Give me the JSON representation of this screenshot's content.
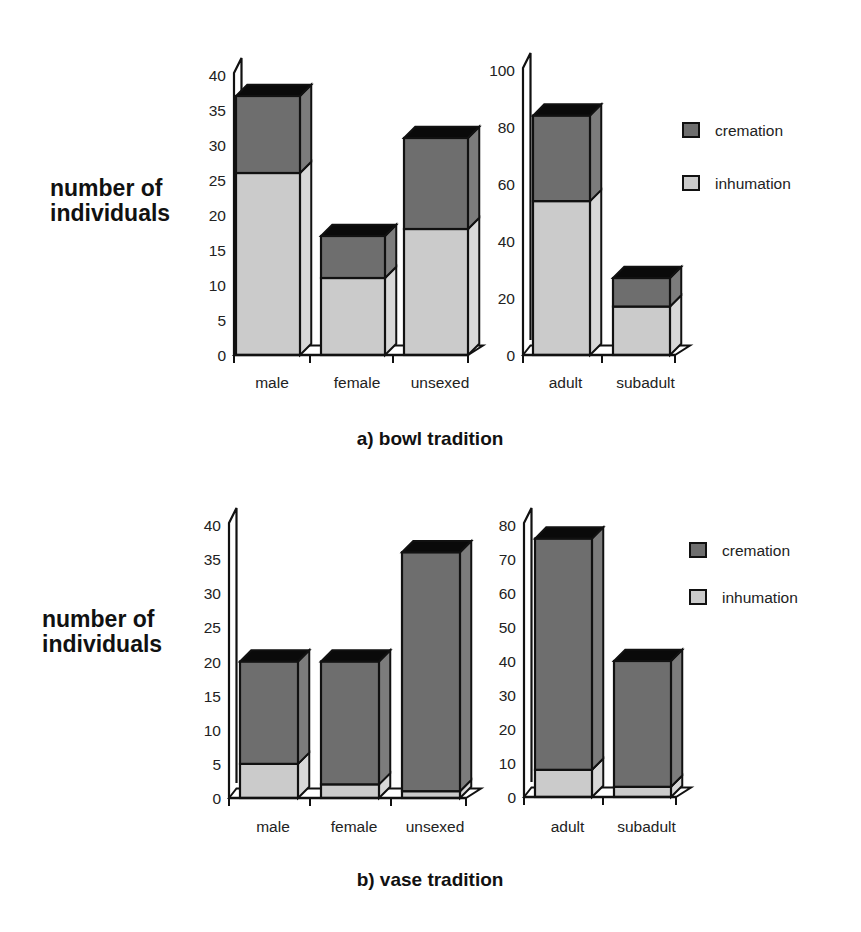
{
  "colors": {
    "cremation": "#6e6e6e",
    "cremation_side": "#7c7c7c",
    "inhumation": "#cbcbcb",
    "inhumation_side": "#d8d8d8",
    "top_face": "#0a0a0a",
    "outline": "#111111",
    "wall": "#ffffff"
  },
  "legend": [
    {
      "key": "cremation",
      "label": "cremation"
    },
    {
      "key": "inhumation",
      "label": "inhumation"
    }
  ],
  "panels": [
    {
      "title": "a) bowl tradition",
      "ylabel_lines": [
        "number of",
        "individuals"
      ]
    },
    {
      "title": "b) vase tradition",
      "ylabel_lines": [
        "number of",
        "individuals"
      ]
    }
  ],
  "chart_data": [
    {
      "type": "bar",
      "stacked": true,
      "panel": "a) bowl tradition",
      "title": "a) bowl tradition",
      "ylabel": "number of individuals",
      "xlabel": "",
      "categories": [
        "male",
        "female",
        "unsexed"
      ],
      "series": [
        {
          "name": "inhumation",
          "values": [
            26,
            11,
            18
          ]
        },
        {
          "name": "cremation",
          "values": [
            11,
            6,
            13
          ]
        }
      ],
      "yticks": [
        0,
        5,
        10,
        15,
        20,
        25,
        30,
        35,
        40
      ],
      "ylim": [
        0,
        40
      ],
      "grid": false,
      "style": "3d"
    },
    {
      "type": "bar",
      "stacked": true,
      "panel": "a) bowl tradition",
      "title": "",
      "ylabel": "",
      "xlabel": "",
      "categories": [
        "adult",
        "subadult"
      ],
      "series": [
        {
          "name": "inhumation",
          "values": [
            54,
            17
          ]
        },
        {
          "name": "cremation",
          "values": [
            30,
            10
          ]
        }
      ],
      "yticks": [
        0,
        20,
        40,
        60,
        80,
        100
      ],
      "ylim": [
        0,
        100
      ],
      "grid": false,
      "legend": {
        "entries": [
          "cremation",
          "inhumation"
        ],
        "position": "right"
      },
      "style": "3d"
    },
    {
      "type": "bar",
      "stacked": true,
      "panel": "b) vase tradition",
      "title": "b) vase tradition",
      "ylabel": "number of individuals",
      "xlabel": "",
      "categories": [
        "male",
        "female",
        "unsexed"
      ],
      "series": [
        {
          "name": "inhumation",
          "values": [
            5,
            2,
            1
          ]
        },
        {
          "name": "cremation",
          "values": [
            15,
            18,
            35
          ]
        }
      ],
      "yticks": [
        0,
        5,
        10,
        15,
        20,
        25,
        30,
        35,
        40
      ],
      "ylim": [
        0,
        40
      ],
      "grid": false,
      "style": "3d"
    },
    {
      "type": "bar",
      "stacked": true,
      "panel": "b) vase tradition",
      "title": "",
      "ylabel": "",
      "xlabel": "",
      "categories": [
        "adult",
        "subadult"
      ],
      "series": [
        {
          "name": "inhumation",
          "values": [
            8,
            3
          ]
        },
        {
          "name": "cremation",
          "values": [
            68,
            37
          ]
        }
      ],
      "yticks": [
        0,
        10,
        20,
        30,
        40,
        50,
        60,
        70,
        80
      ],
      "ylim": [
        0,
        80
      ],
      "grid": false,
      "legend": {
        "entries": [
          "cremation",
          "inhumation"
        ],
        "position": "right"
      },
      "style": "3d"
    }
  ]
}
